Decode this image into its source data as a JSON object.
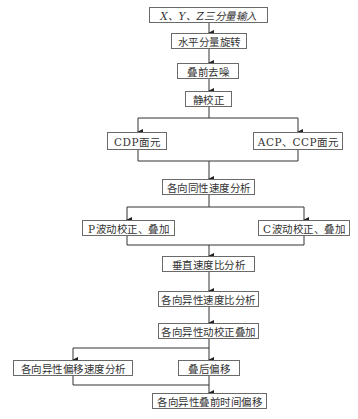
{
  "diagram": {
    "title": "",
    "nodes": [
      {
        "id": "input",
        "label": "X、Y、Z三分量输入"
      },
      {
        "id": "rotate",
        "label": "水平分量旋转"
      },
      {
        "id": "denoise",
        "label": "叠前去噪"
      },
      {
        "id": "static",
        "label": "静校正"
      },
      {
        "id": "cdp",
        "label": "CDP面元"
      },
      {
        "id": "acp_ccp",
        "label": "ACP、CCP面元"
      },
      {
        "id": "iso_velocity",
        "label": "各向同性速度分析"
      },
      {
        "id": "p_wave",
        "label": "P波动校正、叠加"
      },
      {
        "id": "c_wave",
        "label": "C波动校正、叠加"
      },
      {
        "id": "vertical_ratio",
        "label": "垂直速度比分析"
      },
      {
        "id": "aniso_ratio",
        "label": "各向异性速度比分析"
      },
      {
        "id": "aniso_nmo",
        "label": "各向异性动校正叠加"
      },
      {
        "id": "aniso_mig_velocity",
        "label": "各向异性偏移速度分析"
      },
      {
        "id": "post_stack_mig",
        "label": "叠后偏移"
      },
      {
        "id": "aniso_prestack_mig",
        "label": "各向异性叠前时间偏移"
      }
    ],
    "edges": [
      {
        "from": "input",
        "to": "rotate"
      },
      {
        "from": "rotate",
        "to": "denoise"
      },
      {
        "from": "denoise",
        "to": "static"
      },
      {
        "from": "static",
        "to": "cdp"
      },
      {
        "from": "static",
        "to": "acp_ccp"
      },
      {
        "from": "cdp",
        "to": "iso_velocity"
      },
      {
        "from": "acp_ccp",
        "to": "iso_velocity"
      },
      {
        "from": "iso_velocity",
        "to": "p_wave"
      },
      {
        "from": "iso_velocity",
        "to": "c_wave"
      },
      {
        "from": "p_wave",
        "to": "vertical_ratio"
      },
      {
        "from": "c_wave",
        "to": "vertical_ratio"
      },
      {
        "from": "vertical_ratio",
        "to": "aniso_ratio"
      },
      {
        "from": "aniso_ratio",
        "to": "aniso_nmo"
      },
      {
        "from": "aniso_nmo",
        "to": "aniso_mig_velocity"
      },
      {
        "from": "aniso_nmo",
        "to": "post_stack_mig"
      },
      {
        "from": "aniso_mig_velocity",
        "to": "aniso_prestack_mig"
      },
      {
        "from": "post_stack_mig",
        "to": "aniso_prestack_mig"
      }
    ],
    "colors": {
      "line": "#333333",
      "border": "#6a6a6a",
      "text": "#333333",
      "background": "#ffffff"
    }
  }
}
